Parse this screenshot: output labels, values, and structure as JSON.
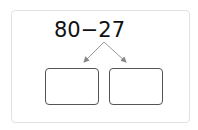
{
  "expression": {
    "left": "80",
    "operator": "−",
    "right": "27"
  },
  "decomposition_boxes": [
    {
      "value": ""
    },
    {
      "value": ""
    }
  ],
  "colors": {
    "text": "#111111",
    "arrow": "#888888",
    "box_border": "#555555",
    "frame_border": "#e2e2e2"
  }
}
